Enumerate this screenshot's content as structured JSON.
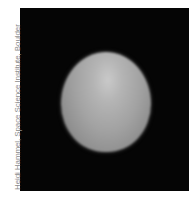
{
  "image": {
    "subject": "planet-disk",
    "description": "Grayscale telescope image of a planet disk on black background"
  },
  "credit": {
    "text": "Heidi Hammel, Space Science Institute, Boulder"
  },
  "colors": {
    "background": "#ffffff",
    "frame": "#050505",
    "planet_highlight": "#c9c9c9",
    "planet_mid": "#a2a2a2",
    "credit_text": "#8a8a8a"
  }
}
